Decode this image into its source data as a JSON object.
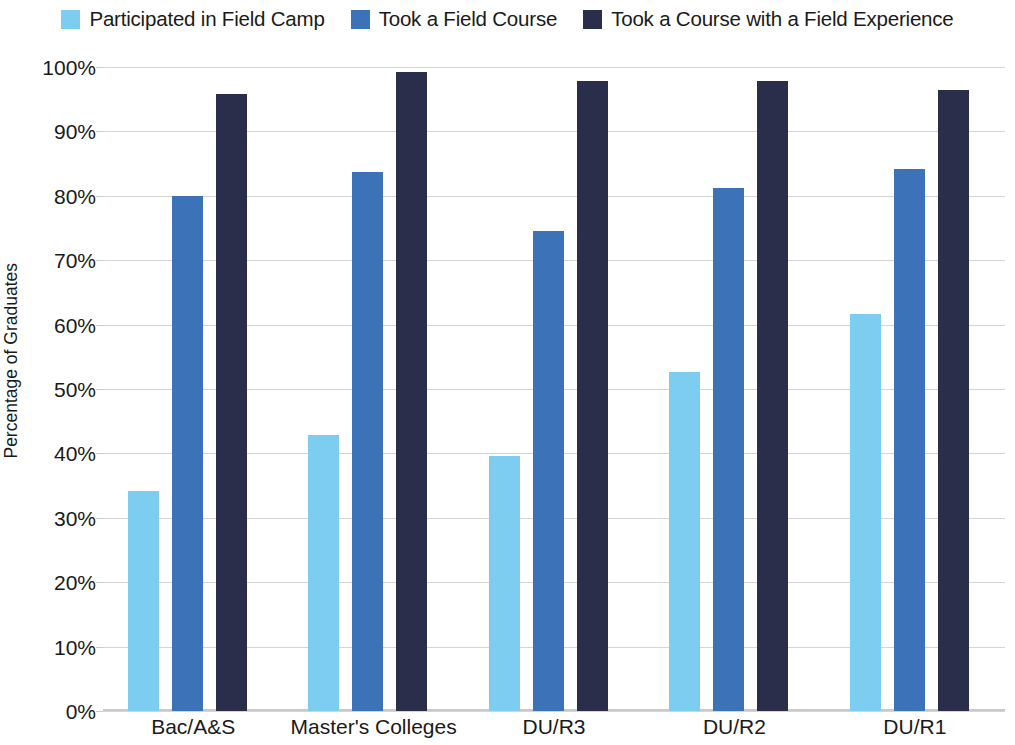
{
  "chart_data": {
    "type": "bar",
    "title": "",
    "subtitle": "",
    "xlabel": "",
    "ylabel": "Percentage of Graduates",
    "ylim": [
      0,
      100
    ],
    "ytick_labels": [
      "100%",
      "90%",
      "80%",
      "70%",
      "60%",
      "50%",
      "40%",
      "30%",
      "20%",
      "10%",
      "0%"
    ],
    "ytick_values": [
      100,
      90,
      80,
      70,
      60,
      50,
      40,
      30,
      20,
      10,
      0
    ],
    "grid": true,
    "legend_position": "top-center",
    "categories": [
      "Bac/A&S",
      "Master's Colleges",
      "DU/R3",
      "DU/R2",
      "DU/R1"
    ],
    "series": [
      {
        "name": "Participated in Field Camp",
        "color": "#7DCDF0",
        "values": [
          34.1,
          42.8,
          39.6,
          52.6,
          61.6
        ]
      },
      {
        "name": "Took a Field Course",
        "color": "#3B72B8",
        "values": [
          80.0,
          83.7,
          74.6,
          81.2,
          84.2
        ]
      },
      {
        "name": "Took a Course with a Field Experience",
        "color": "#2B2E4A",
        "values": [
          95.8,
          99.2,
          97.9,
          97.8,
          96.4
        ]
      }
    ]
  },
  "colors": {
    "series_light_blue": "#7DCDF0",
    "series_medium_blue": "#3B72B8",
    "series_dark_navy": "#2B2E4A",
    "gridline": "#d4d4d4",
    "text": "#1a1a1a",
    "background": "#ffffff"
  }
}
